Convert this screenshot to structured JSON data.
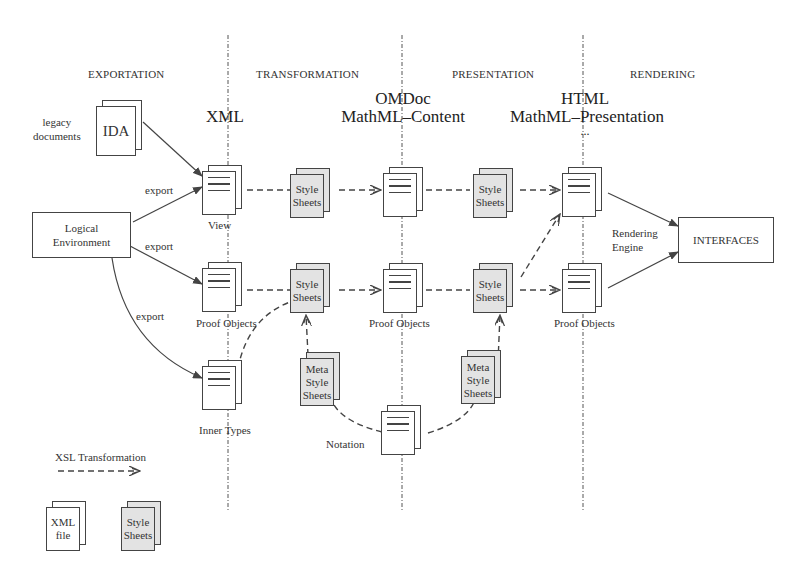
{
  "phases": [
    "EXPORTATION",
    "TRANSFORMATION",
    "PRESENTATION",
    "RENDERING"
  ],
  "formats": {
    "xml": "XML",
    "omdoc_line1": "OMDoc",
    "omdoc_line2": "MathML–Content",
    "html_line1": "HTML",
    "html_line2": "MathML–Presentation",
    "html_line3": "..."
  },
  "nodes": {
    "ida": "IDA",
    "legacy_line1": "legacy",
    "legacy_line2": "documents",
    "logical_line1": "Logical",
    "logical_line2": "Environment",
    "view": "View",
    "proof_objects_xml": "Proof Objects",
    "inner_types": "Inner Types",
    "style_sheets_1_line1": "Style",
    "style_sheets_1_line2": "Sheets",
    "style_sheets_2_line1": "Style",
    "style_sheets_2_line2": "Sheets",
    "style_sheets_3_line1": "Style",
    "style_sheets_3_line2": "Sheets",
    "style_sheets_4_line1": "Style",
    "style_sheets_4_line2": "Sheets",
    "meta_1_line1": "Meta",
    "meta_1_line2": "Style",
    "meta_1_line3": "Sheets",
    "meta_2_line1": "Meta",
    "meta_2_line2": "Style",
    "meta_2_line3": "Sheets",
    "proof_objects_omdoc": "Proof Objects",
    "notation": "Notation",
    "proof_objects_html": "Proof Objects",
    "rendering_engine_line1": "Rendering",
    "rendering_engine_line2": "Engine",
    "interfaces": "INTERFACES"
  },
  "edges": {
    "export_1": "export",
    "export_2": "export",
    "export_3": "export"
  },
  "legend": {
    "xsl": "XSL Transformation",
    "xml_file_line1": "XML",
    "xml_file_line2": "file",
    "style_line1": "Style",
    "style_line2": "Sheets"
  }
}
